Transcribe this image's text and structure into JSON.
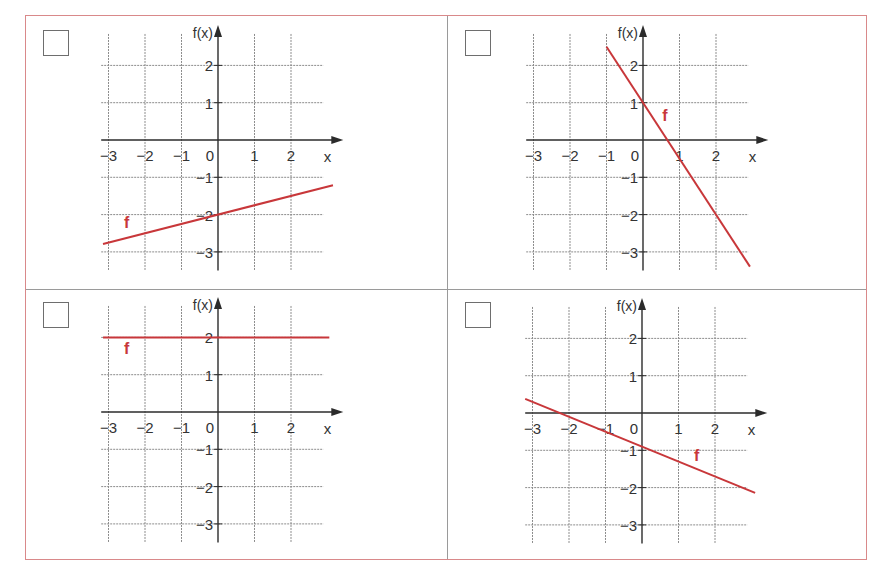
{
  "colors": {
    "frame_border": "#d9898a",
    "divider": "#9a9a9a",
    "grid": "#8c8c8c",
    "axis": "#2b2b2b",
    "function_line": "#c8373a",
    "label_text": "#333333"
  },
  "axis_labels": {
    "y": "f(x)",
    "x": "x",
    "origin": "0"
  },
  "chart_data": [
    {
      "type": "line",
      "panel": "top-left",
      "function_label": "f",
      "equation": "f(x) = 0.25x - 2",
      "slope": 0.25,
      "intercept": -2,
      "x_range": [
        -3.15,
        3.15
      ],
      "points": [
        [
          -3,
          -2.75
        ],
        [
          0,
          -2
        ],
        [
          3,
          -1.25
        ]
      ],
      "xlabel": "x",
      "ylabel": "f(x)",
      "x_ticks": [
        "-3",
        "-2",
        "-1",
        "0",
        "1",
        "2"
      ],
      "y_ticks": [
        "2",
        "1",
        "-1",
        "-2",
        "-3"
      ],
      "xlim": [
        -3.2,
        3.1
      ],
      "ylim": [
        -3.5,
        2.7
      ],
      "grid": true,
      "label_pos": [
        -2.5,
        -2.35
      ]
    },
    {
      "type": "line",
      "panel": "top-right",
      "function_label": "f",
      "equation": "f(x) = -1.5x + 1",
      "slope": -1.5,
      "intercept": 1,
      "x_range": [
        -1,
        2.93
      ],
      "points": [
        [
          -1,
          2.5
        ],
        [
          0,
          1
        ],
        [
          2,
          -2
        ]
      ],
      "xlabel": "x",
      "ylabel": "f(x)",
      "x_ticks": [
        "-3",
        "-2",
        "-1",
        "0",
        "1",
        "2"
      ],
      "y_ticks": [
        "2",
        "1",
        "-1",
        "-2",
        "-3"
      ],
      "xlim": [
        -3.2,
        3.1
      ],
      "ylim": [
        -3.5,
        2.7
      ],
      "grid": true,
      "label_pos": [
        0.6,
        0.5
      ]
    },
    {
      "type": "line",
      "panel": "bottom-left",
      "function_label": "f",
      "equation": "f(x) = 2",
      "slope": 0,
      "intercept": 2,
      "x_range": [
        -3.15,
        3.05
      ],
      "points": [
        [
          -3,
          2
        ],
        [
          0,
          2
        ],
        [
          3,
          2
        ]
      ],
      "xlabel": "x",
      "ylabel": "f(x)",
      "x_ticks": [
        "-3",
        "-2",
        "-1",
        "0",
        "1",
        "2"
      ],
      "y_ticks": [
        "2",
        "1",
        "-1",
        "-2",
        "-3"
      ],
      "xlim": [
        -3.2,
        3.1
      ],
      "ylim": [
        -3.5,
        2.7
      ],
      "grid": true,
      "label_pos": [
        -2.5,
        1.55
      ]
    },
    {
      "type": "line",
      "panel": "bottom-right",
      "function_label": "f",
      "equation": "f(x) = -0.4x - 0.9",
      "slope": -0.4,
      "intercept": -0.9,
      "x_range": [
        -3.2,
        3.1
      ],
      "points": [
        [
          -3,
          0.3
        ],
        [
          0,
          -0.9
        ],
        [
          2,
          -1.7
        ]
      ],
      "xlabel": "x",
      "ylabel": "f(x)",
      "x_ticks": [
        "-3",
        "-2",
        "-1",
        "0",
        "1",
        "2"
      ],
      "y_ticks": [
        "2",
        "1",
        "-1",
        "-2",
        "-3"
      ],
      "xlim": [
        -3.2,
        3.1
      ],
      "ylim": [
        -3.5,
        2.7
      ],
      "grid": true,
      "label_pos": [
        1.5,
        -1.3
      ]
    }
  ],
  "panels": [
    {
      "id": "top-left",
      "checkbox_checked": false
    },
    {
      "id": "top-right",
      "checkbox_checked": false
    },
    {
      "id": "bottom-left",
      "checkbox_checked": false
    },
    {
      "id": "bottom-right",
      "checkbox_checked": false
    }
  ]
}
